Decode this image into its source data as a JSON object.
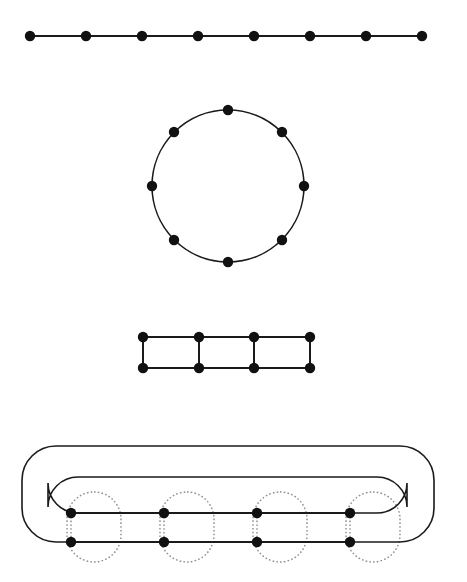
{
  "figure": {
    "width": 467,
    "height": 582,
    "background": "#ffffff",
    "stroke_color": "#1a1a1a",
    "node_color": "#111111",
    "dotted_color": "#8c8c8c",
    "edge_width": 2,
    "curve_width": 1.6,
    "dotted_width": 1.4,
    "node_radius": 5.2
  },
  "panels": [
    {
      "id": "path-graph",
      "name": "path-graph-P8",
      "type": "path",
      "node_count": 8,
      "nodes": [
        {
          "id": "p1",
          "x": 30,
          "y": 36
        },
        {
          "id": "p2",
          "x": 86,
          "y": 36
        },
        {
          "id": "p3",
          "x": 142,
          "y": 36
        },
        {
          "id": "p4",
          "x": 198,
          "y": 36
        },
        {
          "id": "p5",
          "x": 254,
          "y": 36
        },
        {
          "id": "p6",
          "x": 310,
          "y": 36
        },
        {
          "id": "p7",
          "x": 366,
          "y": 36
        },
        {
          "id": "p8",
          "x": 422,
          "y": 36
        }
      ],
      "edges": [
        [
          "p1",
          "p2"
        ],
        [
          "p2",
          "p3"
        ],
        [
          "p3",
          "p4"
        ],
        [
          "p4",
          "p5"
        ],
        [
          "p5",
          "p6"
        ],
        [
          "p6",
          "p7"
        ],
        [
          "p7",
          "p8"
        ]
      ]
    },
    {
      "id": "cycle-graph",
      "name": "cycle-graph-C8",
      "type": "cycle",
      "node_count": 8,
      "center": {
        "x": 228,
        "y": 186
      },
      "radius": 76,
      "nodes": [
        {
          "id": "c1",
          "x": 228,
          "y": 110
        },
        {
          "id": "c2",
          "x": 282,
          "y": 132
        },
        {
          "id": "c3",
          "x": 304,
          "y": 186
        },
        {
          "id": "c4",
          "x": 282,
          "y": 240
        },
        {
          "id": "c5",
          "x": 228,
          "y": 262
        },
        {
          "id": "c6",
          "x": 174,
          "y": 240
        },
        {
          "id": "c7",
          "x": 152,
          "y": 186
        },
        {
          "id": "c8",
          "x": 174,
          "y": 132
        }
      ],
      "edges": [
        [
          "c1",
          "c2"
        ],
        [
          "c2",
          "c3"
        ],
        [
          "c3",
          "c4"
        ],
        [
          "c4",
          "c5"
        ],
        [
          "c5",
          "c6"
        ],
        [
          "c6",
          "c7"
        ],
        [
          "c7",
          "c8"
        ],
        [
          "c8",
          "c1"
        ]
      ]
    },
    {
      "id": "ladder-graph",
      "name": "ladder-graph-L4",
      "type": "ladder",
      "node_count": 8,
      "columns": 4,
      "rows": 2,
      "top_row_y": 337,
      "bottom_row_y": 368,
      "column_x": [
        143,
        199,
        254,
        310
      ],
      "nodes": [
        {
          "id": "l1",
          "x": 143,
          "y": 337
        },
        {
          "id": "l2",
          "x": 199,
          "y": 337
        },
        {
          "id": "l3",
          "x": 254,
          "y": 337
        },
        {
          "id": "l4",
          "x": 310,
          "y": 337
        },
        {
          "id": "l5",
          "x": 143,
          "y": 368
        },
        {
          "id": "l6",
          "x": 199,
          "y": 368
        },
        {
          "id": "l7",
          "x": 254,
          "y": 368
        },
        {
          "id": "l8",
          "x": 310,
          "y": 368
        }
      ],
      "edges": [
        [
          "l1",
          "l2"
        ],
        [
          "l2",
          "l3"
        ],
        [
          "l3",
          "l4"
        ],
        [
          "l5",
          "l6"
        ],
        [
          "l6",
          "l7"
        ],
        [
          "l7",
          "l8"
        ],
        [
          "l1",
          "l5"
        ],
        [
          "l2",
          "l6"
        ],
        [
          "l3",
          "l7"
        ],
        [
          "l4",
          "l8"
        ]
      ]
    },
    {
      "id": "circular-ladder-graph",
      "name": "circular-ladder-embedding",
      "type": "circular-ladder",
      "node_count": 8,
      "top_row_y": 513,
      "bottom_row_y": 542,
      "column_x": [
        71,
        164,
        257,
        350
      ],
      "nodes": [
        {
          "id": "q1",
          "x": 71,
          "y": 513
        },
        {
          "id": "q2",
          "x": 164,
          "y": 513
        },
        {
          "id": "q3",
          "x": 257,
          "y": 513
        },
        {
          "id": "q4",
          "x": 350,
          "y": 513
        },
        {
          "id": "q5",
          "x": 71,
          "y": 542
        },
        {
          "id": "q6",
          "x": 164,
          "y": 542
        },
        {
          "id": "q7",
          "x": 257,
          "y": 542
        },
        {
          "id": "q8",
          "x": 350,
          "y": 542
        }
      ],
      "edges": [
        [
          "q1",
          "q2"
        ],
        [
          "q2",
          "q3"
        ],
        [
          "q3",
          "q4"
        ],
        [
          "q5",
          "q6"
        ],
        [
          "q6",
          "q7"
        ],
        [
          "q7",
          "q8"
        ]
      ],
      "wrap_curves": [
        {
          "name": "outer-wrap-curve",
          "description": "bottom-left node loops left and over the top to the far right, down to the bottom-right node",
          "left_x": 22,
          "right_x": 434,
          "top_y": 446,
          "corner_radius": 34
        },
        {
          "name": "inner-wrap-curve",
          "description": "top-left node loops left and over to the far right, down to the top-right node",
          "left_x": 48,
          "right_x": 407,
          "top_y": 477,
          "corner_radius": 30
        }
      ],
      "dotted_groups": [
        {
          "name": "dotted-group-1",
          "cx": 94,
          "cy": 527,
          "rx": 27,
          "ry": 35
        },
        {
          "name": "dotted-group-2",
          "cx": 187,
          "cy": 527,
          "rx": 27,
          "ry": 35
        },
        {
          "name": "dotted-group-3",
          "cx": 280,
          "cy": 527,
          "rx": 27,
          "ry": 35
        },
        {
          "name": "dotted-group-4",
          "cx": 373,
          "cy": 527,
          "rx": 27,
          "ry": 35
        }
      ],
      "dotted_connectors": [
        {
          "name": "dotted-rung-1",
          "x": 71,
          "y1": 513,
          "y2": 542
        },
        {
          "name": "dotted-rung-2",
          "x": 164,
          "y1": 513,
          "y2": 542
        },
        {
          "name": "dotted-rung-3",
          "x": 257,
          "y1": 513,
          "y2": 542
        },
        {
          "name": "dotted-rung-4",
          "x": 350,
          "y1": 513,
          "y2": 542
        }
      ]
    }
  ]
}
